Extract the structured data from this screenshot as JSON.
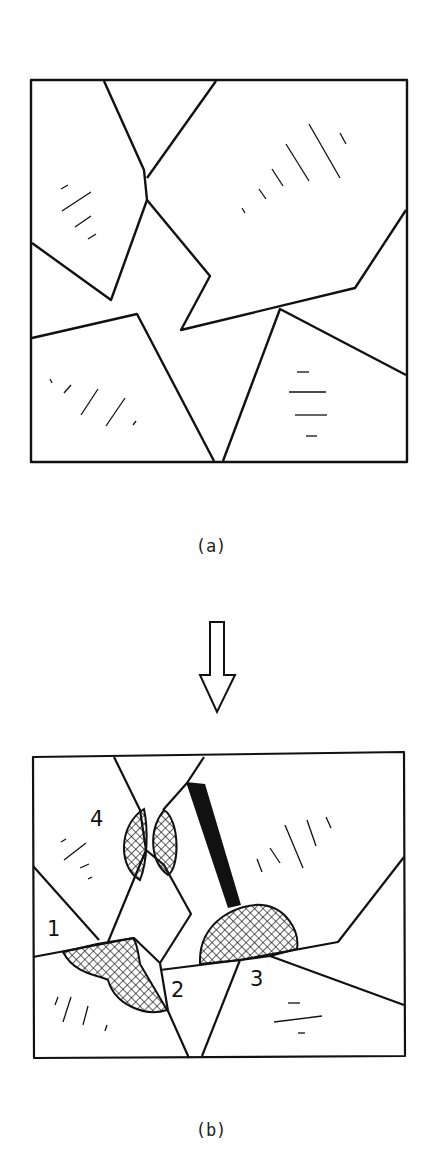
{
  "figure": {
    "panel_a": {
      "caption": "(a)",
      "description": "Polycrystalline grain structure before transformation"
    },
    "arrow": {
      "icon": "down-arrow-icon"
    },
    "panel_b": {
      "caption": "(b)",
      "labels": [
        "1",
        "2",
        "3",
        "4"
      ],
      "description": "Nucleation sites (cross-hatched) at grain boundaries"
    }
  },
  "colors": {
    "line": "#111111",
    "background": "#ffffff"
  }
}
